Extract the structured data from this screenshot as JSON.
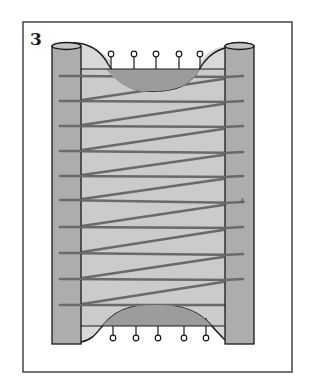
{
  "figure": {
    "number": "3",
    "label_a": "A",
    "colors": {
      "frame": "#2a2a2a",
      "post_fill": "#adadad",
      "sheet_fill": "#cbcbcb",
      "curve_fill": "#9c9c9c",
      "stitch": "#6a6a6a",
      "outline": "#1a1a1a"
    },
    "frame": {
      "x": 23,
      "y": 22,
      "w": 269,
      "h": 350
    },
    "left_post": {
      "x": 52,
      "y": 46,
      "w": 29,
      "h": 298
    },
    "right_post": {
      "x": 225,
      "y": 46,
      "w": 29,
      "h": 298
    },
    "sheet": {
      "x": 81,
      "y": 69,
      "w": 144,
      "h": 257
    },
    "top_pins_x": [
      111,
      134,
      156,
      179,
      200
    ],
    "bottom_pins_x": [
      113,
      136,
      158,
      184,
      206
    ],
    "stitches_left_y": [
      76,
      101,
      126,
      151,
      176,
      200,
      227,
      253,
      279,
      305
    ],
    "stitches_right_y": [
      77,
      102,
      127,
      153,
      177,
      203,
      228,
      255,
      280
    ]
  }
}
